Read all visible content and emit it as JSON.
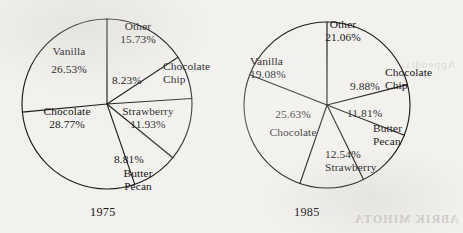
{
  "figure": {
    "bleed_text_bottom": "ABRIK MIHOTA",
    "bleed_text_top": "Appendix"
  },
  "chart_data": [
    {
      "type": "pie",
      "title": "1975",
      "year": "1975",
      "xlabel": "",
      "ylabel": "",
      "legend": "none",
      "grid": false,
      "units": "percent",
      "start_angle_deg": 0,
      "direction": "clockwise",
      "categories": [
        "Other",
        "Chocolate Chip",
        "Strawberry",
        "Butter Pecan",
        "Chocolate",
        "Vanilla"
      ],
      "values": [
        15.73,
        8.23,
        11.93,
        8.81,
        28.77,
        26.53
      ],
      "slices": [
        {
          "name": "Other",
          "value": 15.73,
          "label": "Other",
          "value_text": "15.73%"
        },
        {
          "name": "Chocolate Chip",
          "value": 8.23,
          "label": "Chocolate Chip",
          "value_text": "8.23%"
        },
        {
          "name": "Strawberry",
          "value": 11.93,
          "label": "Strawberry",
          "value_text": "11.93%"
        },
        {
          "name": "Butter Pecan",
          "value": 8.81,
          "label": "Butter Pecan",
          "value_text": "8.81%"
        },
        {
          "name": "Chocolate",
          "value": 28.77,
          "label": "Chocolate",
          "value_text": "28.77%"
        },
        {
          "name": "Vanilla",
          "value": 26.53,
          "label": "Vanilla",
          "value_text": "26.53%"
        }
      ]
    },
    {
      "type": "pie",
      "title": "1985",
      "year": "1985",
      "xlabel": "",
      "ylabel": "",
      "legend": "none",
      "grid": false,
      "units": "percent",
      "start_angle_deg": 0,
      "direction": "clockwise",
      "categories": [
        "Other",
        "Chocolate Chip",
        "Butter Pecan",
        "Strawberry",
        "Chocolate",
        "Vanilla"
      ],
      "values": [
        21.06,
        9.88,
        11.81,
        12.54,
        25.63,
        19.08
      ],
      "slices": [
        {
          "name": "Other",
          "value": 21.06,
          "label": "Other",
          "value_text": "21.06%"
        },
        {
          "name": "Chocolate Chip",
          "value": 9.88,
          "label": "Chocolate Chip",
          "value_text": "9.88%"
        },
        {
          "name": "Butter Pecan",
          "value": 11.81,
          "label": "Butter Pecan",
          "value_text": "11.81%"
        },
        {
          "name": "Strawberry",
          "value": 12.54,
          "label": "Strawberry",
          "value_text": "12.54%"
        },
        {
          "name": "Chocolate",
          "value": 25.63,
          "label": "Chocolate",
          "value_text": "25.63%"
        },
        {
          "name": "Vanilla",
          "value": 19.08,
          "label": "Vanilla",
          "value_text": "19.08%"
        }
      ]
    }
  ],
  "pies": {
    "p1975": {
      "year": "1975",
      "labels": {
        "other": {
          "name": "Other",
          "value": "15.73%"
        },
        "chocolate_chip": {
          "name_line1": "Chocolate",
          "name_line2": "Chip",
          "value": "8.23%"
        },
        "strawberry": {
          "name": "Strawberry",
          "value": "11.93%"
        },
        "butter_pecan": {
          "name_line1": "Butter",
          "name_line2": "Pecan",
          "value": "8.81%"
        },
        "chocolate": {
          "name": "Chocolate",
          "value": "28.77%"
        },
        "vanilla": {
          "name": "Vanilla",
          "value": "26.53%"
        }
      }
    },
    "p1985": {
      "year": "1985",
      "labels": {
        "other": {
          "name": "Other",
          "value": "21.06%"
        },
        "chocolate_chip": {
          "name_line1": "Chocolate",
          "name_line2": "Chip",
          "value": "9.88%"
        },
        "butter_pecan": {
          "name_line1": "Butter",
          "name_line2": "Pecan",
          "value": "11.81%"
        },
        "strawberry": {
          "name": "Strawberry",
          "value": "12.54%"
        },
        "chocolate": {
          "name": "Chocolate",
          "value": "25.63%"
        },
        "vanilla": {
          "name": "Vanilla",
          "value": "19.08%"
        }
      }
    }
  },
  "colors": {
    "ink": "#1c1c1c",
    "paper": "#f2f1ee",
    "slice_fill": "#ffffff"
  }
}
